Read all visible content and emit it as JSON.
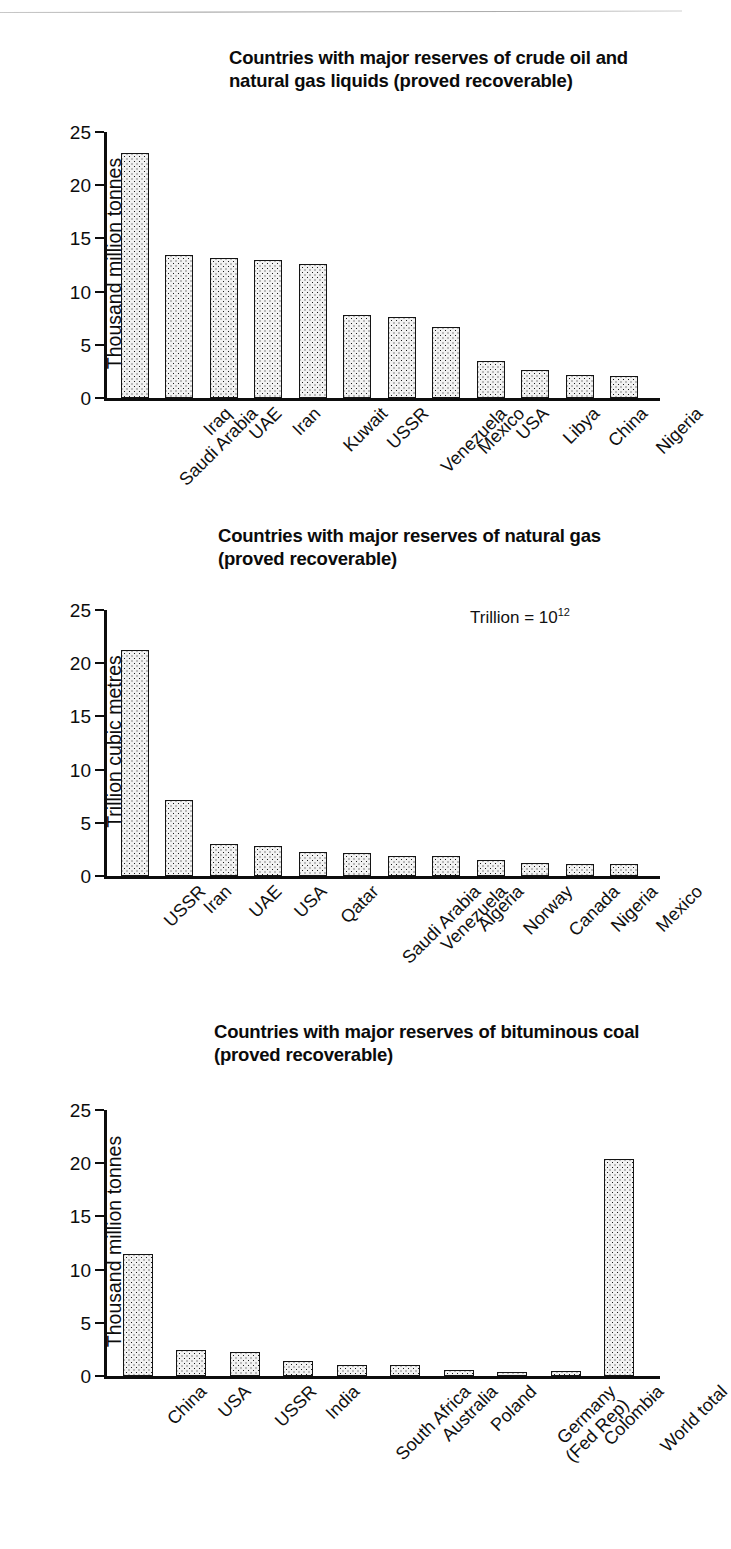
{
  "page": {
    "background": "#ffffff",
    "ink": "#111111"
  },
  "charts": [
    {
      "id": "crude-oil",
      "title": "Countries with major reserves of crude oil and natural gas liquids (proved recoverable)",
      "ylabel": "Thousand million tonnes",
      "note": "",
      "yticks": [
        "0",
        "5",
        "10",
        "15",
        "20",
        "25"
      ],
      "ymax": 25
    },
    {
      "id": "natural-gas",
      "title": "Countries with major reserves of natural gas (proved recoverable)",
      "ylabel": "Trillion cubic metres",
      "note_prefix": "Trillion = 10",
      "note_sup": "12",
      "yticks": [
        "0",
        "5",
        "10",
        "15",
        "20",
        "25"
      ],
      "ymax": 25
    },
    {
      "id": "bituminous-coal",
      "title": "Countries with major reserves of bituminous coal (proved recoverable)",
      "ylabel": "Thousand million tonnes",
      "yticks": [
        "0",
        "5",
        "10",
        "15",
        "20",
        "25"
      ],
      "ymax": 25
    }
  ],
  "chart_data": [
    {
      "type": "bar",
      "title": "Countries with major reserves of crude oil and natural gas liquids (proved recoverable)",
      "xlabel": "",
      "ylabel": "Thousand million tonnes",
      "ylim": [
        0,
        25
      ],
      "yticks": [
        0,
        5,
        10,
        15,
        20,
        25
      ],
      "grid": false,
      "legend": "none",
      "categories": [
        "Saudi Arabia",
        "Iraq",
        "UAE",
        "Iran",
        "Kuwait",
        "USSR",
        "Venezuela",
        "Mexico",
        "USA",
        "Libya",
        "China",
        "Nigeria"
      ],
      "values": [
        23.0,
        13.4,
        13.2,
        13.0,
        12.6,
        7.8,
        7.6,
        6.7,
        3.5,
        2.6,
        2.2,
        2.1
      ]
    },
    {
      "type": "bar",
      "title": "Countries with major reserves of natural gas (proved recoverable)",
      "xlabel": "",
      "ylabel": "Trillion cubic metres",
      "ylim": [
        0,
        25
      ],
      "yticks": [
        0,
        5,
        10,
        15,
        20,
        25
      ],
      "grid": false,
      "legend": "none",
      "annotations": [
        "Trillion = 10^12"
      ],
      "categories": [
        "USSR",
        "Iran",
        "UAE",
        "USA",
        "Qatar",
        "Saudi Arabia",
        "Venezuela",
        "Algeria",
        "Norway",
        "Canada",
        "Nigeria",
        "Mexico"
      ],
      "values": [
        21.2,
        7.1,
        3.0,
        2.8,
        2.3,
        2.2,
        1.9,
        1.9,
        1.5,
        1.2,
        1.1,
        1.1
      ]
    },
    {
      "type": "bar",
      "title": "Countries with major reserves of bituminous coal (proved recoverable)",
      "xlabel": "",
      "ylabel": "Thousand million tonnes",
      "ylim": [
        0,
        25
      ],
      "yticks": [
        0,
        5,
        10,
        15,
        20,
        25
      ],
      "grid": false,
      "legend": "none",
      "categories": [
        "China",
        "USA",
        "USSR",
        "India",
        "South Africa",
        "Australia",
        "Poland",
        "Germany (Fed Rep)",
        "Colombia",
        "World total"
      ],
      "values": [
        11.5,
        2.4,
        2.3,
        1.4,
        1.0,
        1.0,
        0.6,
        0.35,
        0.45,
        20.4
      ]
    }
  ],
  "xlabels": {
    "chart1": [
      {
        "l1": "Saudi Arabia"
      },
      {
        "l1": "Iraq"
      },
      {
        "l1": "UAE"
      },
      {
        "l1": "Iran"
      },
      {
        "l1": "Kuwait"
      },
      {
        "l1": "USSR"
      },
      {
        "l1": "Venezuela"
      },
      {
        "l1": "Mexico"
      },
      {
        "l1": "USA"
      },
      {
        "l1": "Libya"
      },
      {
        "l1": "China"
      },
      {
        "l1": "Nigeria"
      }
    ],
    "chart2": [
      {
        "l1": "USSR"
      },
      {
        "l1": "Iran"
      },
      {
        "l1": "UAE"
      },
      {
        "l1": "USA"
      },
      {
        "l1": "Qatar"
      },
      {
        "l1": "Saudi Arabia"
      },
      {
        "l1": "Venezuela"
      },
      {
        "l1": "Algeria"
      },
      {
        "l1": "Norway"
      },
      {
        "l1": "Canada"
      },
      {
        "l1": "Nigeria"
      },
      {
        "l1": "Mexico"
      }
    ],
    "chart3": [
      {
        "l1": "China"
      },
      {
        "l1": "USA"
      },
      {
        "l1": "USSR"
      },
      {
        "l1": "India"
      },
      {
        "l1": "South Africa"
      },
      {
        "l1": "Australia"
      },
      {
        "l1": "Poland"
      },
      {
        "l1": "Germany",
        "l2": "(Fed Rep)"
      },
      {
        "l1": "Colombia"
      },
      {
        "l1": "World total"
      }
    ]
  }
}
